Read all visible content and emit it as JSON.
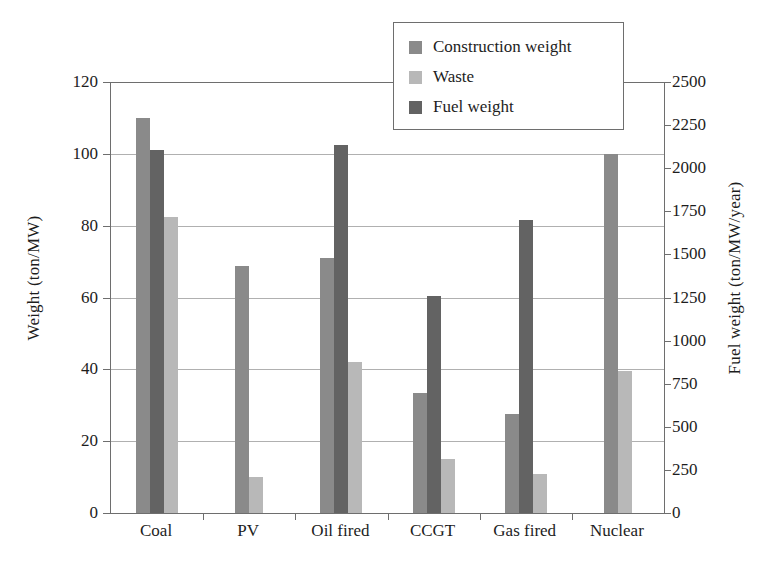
{
  "chart_data": {
    "type": "bar",
    "title": "",
    "subtitle": "",
    "categories": [
      "Coal",
      "PV",
      "Oil fired",
      "CCGT",
      "Gas fired",
      "Nuclear"
    ],
    "series": [
      {
        "name": "Construction weight",
        "axis": "left",
        "color": "#8a8a8a",
        "values": [
          110,
          68.8,
          71,
          33.5,
          27.5,
          100
        ]
      },
      {
        "name": "Fuel weight",
        "axis": "right",
        "color": "#636363",
        "values": [
          101,
          null,
          102.5,
          60.5,
          81.5,
          null
        ]
      },
      {
        "name": "Waste",
        "axis": "left",
        "color": "#b8b8b8",
        "values": [
          82.5,
          10,
          42,
          15,
          11,
          39.5
        ]
      }
    ],
    "draw_order": [
      "Construction weight",
      "Fuel weight",
      "Waste"
    ],
    "xlabel": "",
    "ylabel": "Weight (ton/MW)",
    "y2label": "Fuel weight (ton/MW/year)",
    "ylim": [
      0,
      120
    ],
    "yticks": [
      0,
      20,
      40,
      60,
      80,
      100,
      120
    ],
    "y2lim": [
      0,
      2500
    ],
    "y2ticks": [
      0,
      250,
      500,
      750,
      1000,
      1250,
      1500,
      1750,
      2000,
      2250,
      2500
    ],
    "grid": true,
    "grid_axis": "y-left",
    "legend_position": "top-right",
    "legend": [
      {
        "label": "Construction weight",
        "color": "#8a8a8a"
      },
      {
        "label": "Waste",
        "color": "#b8b8b8"
      },
      {
        "label": "Fuel weight",
        "color": "#636363"
      }
    ],
    "fuel_weight_right_axis_values": [
      2104,
      null,
      2135,
      1260,
      1698,
      null
    ]
  }
}
